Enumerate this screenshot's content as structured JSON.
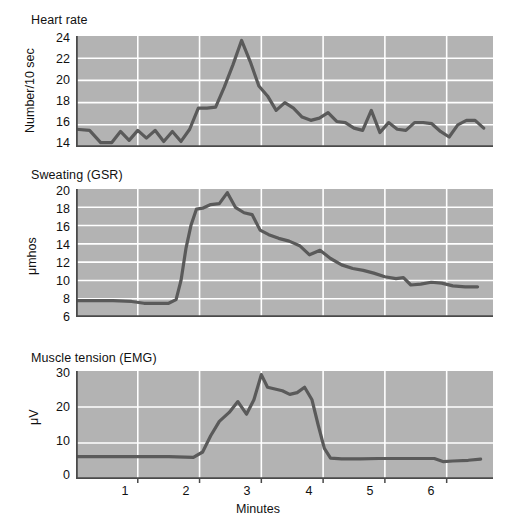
{
  "figure": {
    "background_color": "#ffffff",
    "plot_fill_color": "#b3b3b3",
    "grid_color": "#ffffff",
    "line_color": "#5a5a5a",
    "axis_color": "#4a4a4a",
    "text_color": "#111111",
    "x_axis_label": "Minutes",
    "x_ticks": [
      "1",
      "2",
      "3",
      "4",
      "5",
      "6"
    ],
    "x_tick_values": [
      1,
      2,
      3,
      4,
      5,
      6
    ],
    "x_range": [
      0,
      6.75
    ]
  },
  "panels": {
    "heart_rate": {
      "title": "Heart rate",
      "ylabel": "Number/10 sec",
      "y_ticks": [
        "14",
        "16",
        "18",
        "20",
        "22",
        "24"
      ]
    },
    "gsr": {
      "title": "Sweating (GSR)",
      "ylabel": "μmhos",
      "y_ticks": [
        "6",
        "8",
        "10",
        "12",
        "14",
        "16",
        "18",
        "20"
      ]
    },
    "emg": {
      "title": "Muscle tension (EMG)",
      "ylabel": "μV",
      "y_ticks": [
        "0",
        "10",
        "20",
        "30"
      ]
    }
  },
  "chart_data": [
    {
      "type": "line",
      "title": "Heart rate",
      "xlabel": "",
      "ylabel": "Number/10 sec",
      "xlim": [
        0,
        6.75
      ],
      "ylim": [
        14,
        24
      ],
      "grid": true,
      "x": [
        0.0,
        0.22,
        0.4,
        0.58,
        0.72,
        0.86,
        1.0,
        1.14,
        1.28,
        1.42,
        1.56,
        1.7,
        1.84,
        1.98,
        2.12,
        2.26,
        2.4,
        2.54,
        2.68,
        2.82,
        2.96,
        3.1,
        3.24,
        3.38,
        3.52,
        3.66,
        3.8,
        3.94,
        4.08,
        4.22,
        4.36,
        4.5,
        4.64,
        4.78,
        4.92,
        5.06,
        5.2,
        5.34,
        5.48,
        5.62,
        5.76,
        5.9,
        6.04,
        6.18,
        6.32,
        6.46,
        6.6
      ],
      "y": [
        15.6,
        15.5,
        14.4,
        14.4,
        15.4,
        14.6,
        15.5,
        14.8,
        15.5,
        14.5,
        15.4,
        14.5,
        15.6,
        17.5,
        17.5,
        17.6,
        19.4,
        21.4,
        23.6,
        21.7,
        19.5,
        18.6,
        17.3,
        18.0,
        17.5,
        16.7,
        16.4,
        16.6,
        17.1,
        16.3,
        16.2,
        15.7,
        15.5,
        17.3,
        15.3,
        16.2,
        15.6,
        15.5,
        16.2,
        16.2,
        16.1,
        15.4,
        14.9,
        16.0,
        16.4,
        16.4,
        15.7
      ]
    },
    {
      "type": "line",
      "title": "Sweating (GSR)",
      "xlabel": "",
      "ylabel": "μmhos",
      "xlim": [
        0,
        6.75
      ],
      "ylim": [
        6,
        20
      ],
      "grid": true,
      "x": [
        0.0,
        0.3,
        0.6,
        0.9,
        1.1,
        1.3,
        1.5,
        1.62,
        1.7,
        1.78,
        1.86,
        1.95,
        2.05,
        2.18,
        2.32,
        2.45,
        2.58,
        2.72,
        2.85,
        2.98,
        3.12,
        3.28,
        3.45,
        3.62,
        3.78,
        3.95,
        4.12,
        4.3,
        4.48,
        4.65,
        4.82,
        5.0,
        5.18,
        5.3,
        5.42,
        5.58,
        5.75,
        5.92,
        6.1,
        6.3,
        6.5
      ],
      "y": [
        7.8,
        7.8,
        7.8,
        7.7,
        7.5,
        7.5,
        7.5,
        7.9,
        10.0,
        13.5,
        16.0,
        17.8,
        17.9,
        18.3,
        18.4,
        19.6,
        18.0,
        17.4,
        17.2,
        15.5,
        15.0,
        14.6,
        14.3,
        13.8,
        12.8,
        13.3,
        12.4,
        11.7,
        11.3,
        11.1,
        10.8,
        10.4,
        10.2,
        10.3,
        9.5,
        9.6,
        9.8,
        9.7,
        9.4,
        9.3,
        9.3
      ]
    },
    {
      "type": "line",
      "title": "Muscle tension (EMG)",
      "xlabel": "Minutes",
      "ylabel": "μV",
      "xlim": [
        0,
        6.75
      ],
      "ylim": [
        0,
        30
      ],
      "grid": true,
      "x": [
        0.0,
        0.5,
        1.0,
        1.5,
        1.9,
        2.05,
        2.18,
        2.32,
        2.48,
        2.62,
        2.76,
        2.88,
        3.0,
        3.1,
        3.22,
        3.34,
        3.46,
        3.58,
        3.7,
        3.82,
        3.92,
        4.02,
        4.12,
        4.3,
        4.6,
        4.9,
        5.2,
        5.5,
        5.8,
        5.95,
        6.1,
        6.35,
        6.55
      ],
      "y": [
        6.2,
        6.2,
        6.2,
        6.2,
        6.0,
        7.5,
        12.0,
        16.0,
        18.5,
        21.5,
        18.0,
        22.0,
        29.0,
        25.5,
        25.0,
        24.5,
        23.5,
        24.0,
        25.5,
        22.0,
        15.0,
        8.5,
        5.8,
        5.6,
        5.6,
        5.7,
        5.7,
        5.7,
        5.7,
        4.8,
        5.0,
        5.2,
        5.5
      ]
    }
  ]
}
